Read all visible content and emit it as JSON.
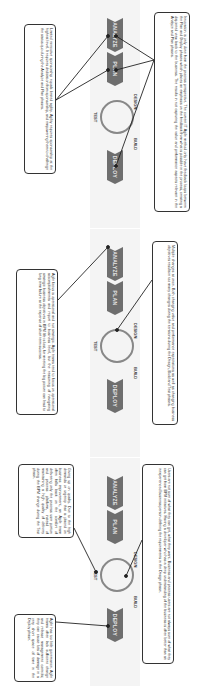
{
  "stages": [
    "ANALYZE",
    "PLAN",
    "DESIGN",
    "BUILD",
    "TEST",
    "DEPLOY"
  ],
  "panels": [
    {
      "top_note": "Users are not sure of what they can get, what they want. Business and process users are not always sure of what they can get from BPM initiatives. Having a developer who has a deep understanding of the business is often better than an inexperienced business person defining the requirements in the Design phase.",
      "bottom_left_note": "Giving up on quality. Due to the high demands or urgency that is placed on business improvement, an Agile team often falls back on the comfort of delivering only the process user portion and process platform, instead of maintaining a high quality of delivery during the BPM change during the Test phase.",
      "bottom_right_note": "Agile has too little governance. Agile teams often lack sufficient change and release management controls; they can cause lots of damage in a very short space of time in the Deploy phase."
    },
    {
      "top_note": "Multiple changes at once. Both changing value and performance expectations as well as changing business objectives results in too many changes during the iterations during the Design, Build and Test phases.",
      "bottom_note": "Agile focus is operational and not strategic. Agile teams tend to focus on operational accomplishments and report to business level, but the reasoning of navigating strategic business objectives in BPM life is lost, for meeting the big picture can lead to long term failure at the expense of short term success."
    },
    {
      "top_note": "Innovation is only done from the process perspective. The current IT Agile method only have feedback loops between the Plan and Deploy phases which places an emphasis on the feedback from what is possible in the process, creating a disjointed view back to the business. The results in not capturing the value and performance aspects relevant in the Analyze and Plan phases.",
      "bottom_note": "Limited executive sponsorship equals limited agility. Agility requires sponsorship at the highest level. It requires dedication from sponsorship, and empowering them to challenge the status quo during the Analyze and Plan phases."
    }
  ]
}
